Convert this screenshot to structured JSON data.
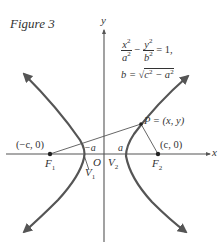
{
  "figure": {
    "title": "Figure 3",
    "equation_line1_lhs_num1": "x",
    "equation_line1_lhs_den1": "a",
    "equation_line1_lhs_num2": "y",
    "equation_line1_lhs_den2": "b",
    "equation_exp": "2",
    "equation_minus": "−",
    "equation_rhs": "= 1,",
    "equation_line2_b": "b =",
    "equation_line2_rad_c": "c",
    "equation_line2_rad_minus": "− a",
    "equation_full": "x^2/a^2 − y^2/b^2 = 1, b = √(c^2 − a^2)"
  },
  "axes": {
    "x_label": "x",
    "y_label": "y",
    "origin_label": "O"
  },
  "points": {
    "f1_label": "F",
    "f1_sub": "1",
    "f1_coords": "(−c, 0)",
    "f2_label": "F",
    "f2_sub": "2",
    "f2_coords": "(c, 0)",
    "v1_label": "V",
    "v1_sub": "1",
    "v2_label": "V",
    "v2_sub": "2",
    "neg_a_label": "−a",
    "a_label": "a",
    "p_label": "P = (x, y)"
  },
  "colors": {
    "curve": "#555555",
    "axis": "#555555",
    "text": "#333333",
    "background": "#ffffff"
  }
}
